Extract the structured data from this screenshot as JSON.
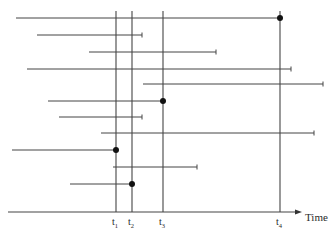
{
  "diagram": {
    "type": "interval-timeline",
    "axis": {
      "label": "Time",
      "x1": 8,
      "x2": 302,
      "y": 212
    },
    "stroke_color": "#444444",
    "dot_color": "#111111",
    "time_markers": [
      {
        "id": "t1",
        "base": "t",
        "sub": "1",
        "x": 116
      },
      {
        "id": "t2",
        "base": "t",
        "sub": "2",
        "x": 132
      },
      {
        "id": "t3",
        "base": "t",
        "sub": "3",
        "x": 163
      },
      {
        "id": "t4",
        "base": "t",
        "sub": "4",
        "x": 280
      }
    ],
    "marker_top_y": 11,
    "intervals": [
      {
        "y": 18,
        "x1": 16,
        "x2": 280,
        "end": "dot"
      },
      {
        "y": 35,
        "x1": 37,
        "x2": 142,
        "end": "tick"
      },
      {
        "y": 52,
        "x1": 89,
        "x2": 216,
        "end": "tick"
      },
      {
        "y": 69,
        "x1": 27,
        "x2": 291,
        "end": "tick"
      },
      {
        "y": 84,
        "x1": 143,
        "x2": 323,
        "end": "tick"
      },
      {
        "y": 101,
        "x1": 48,
        "x2": 163,
        "end": "dot"
      },
      {
        "y": 117,
        "x1": 59,
        "x2": 142,
        "end": "tick"
      },
      {
        "y": 133,
        "x1": 101,
        "x2": 314,
        "end": "tick"
      },
      {
        "y": 150,
        "x1": 12,
        "x2": 116,
        "end": "dot"
      },
      {
        "y": 167,
        "x1": 113,
        "x2": 197,
        "end": "tick"
      },
      {
        "y": 184,
        "x1": 70,
        "x2": 132,
        "end": "dot"
      }
    ]
  }
}
